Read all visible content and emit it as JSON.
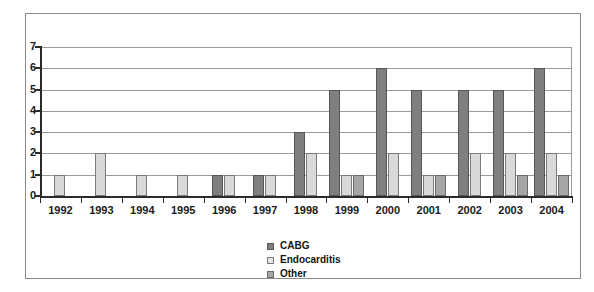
{
  "chart_data": {
    "type": "bar",
    "title": "",
    "subtitle": "",
    "xlabel": "",
    "ylabel": "",
    "ylim": [
      0,
      7
    ],
    "ytick_labels": [
      "0",
      "1",
      "2",
      "3",
      "4",
      "5",
      "6",
      "7"
    ],
    "grid": true,
    "legend_position": "bottom-center",
    "categories": [
      "1992",
      "1993",
      "1994",
      "1995",
      "1996",
      "1997",
      "1998",
      "1999",
      "2000",
      "2001",
      "2002",
      "2003",
      "2004"
    ],
    "series": [
      {
        "name": "CABG",
        "color": "#7f7f7f",
        "values": [
          0,
          0,
          0,
          0,
          1,
          1,
          3,
          5,
          6,
          5,
          5,
          5,
          6
        ]
      },
      {
        "name": "Endocarditis",
        "color": "#d9d9d9",
        "values": [
          1,
          2,
          1,
          1,
          1,
          1,
          2,
          1,
          2,
          1,
          2,
          2,
          2
        ]
      },
      {
        "name": "Other",
        "color": "#a6a6a6",
        "values": [
          0,
          0,
          0,
          0,
          0,
          0,
          0,
          1,
          0,
          1,
          0,
          1,
          1
        ]
      }
    ]
  },
  "legend": {
    "items": [
      {
        "label": "CABG",
        "swatch": "cabg"
      },
      {
        "label": "Endocarditis",
        "swatch": "endo"
      },
      {
        "label": "Other",
        "swatch": "other"
      }
    ]
  }
}
